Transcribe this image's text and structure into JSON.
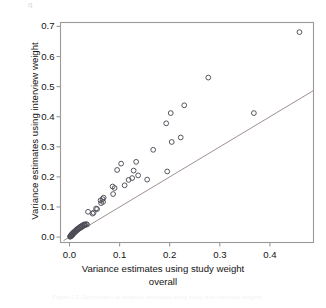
{
  "figure": {
    "top_artifact_text": "g",
    "bottom_artifact_text": "Figure 3.2 Comparison of variance estimates using study and interview weights"
  },
  "chart_data": {
    "type": "scatter",
    "title": "",
    "xlabel": "Variance estimates using study weight",
    "xlabel_line2": "overall",
    "ylabel": "Variance estimates using interview weight",
    "xlim": [
      -0.018,
      0.487
    ],
    "ylim": [
      -0.018,
      0.713
    ],
    "xticks": [
      0.0,
      0.1,
      0.2,
      0.3,
      0.4
    ],
    "xticklabels": [
      "0.0",
      "0.1",
      "0.2",
      "0.3",
      "0.4"
    ],
    "yticks": [
      0.0,
      0.1,
      0.2,
      0.3,
      0.4,
      0.5,
      0.6,
      0.7
    ],
    "yticklabels": [
      "0.0",
      "0.1",
      "0.2",
      "0.3",
      "0.4",
      "0.5",
      "0.6",
      "0.7"
    ],
    "grid": false,
    "legend": null,
    "marker": "open-circle",
    "marker_color": "#4d4d57",
    "marker_radius_px": 2.4,
    "frame_color": "#9a9a9a",
    "reference_line": {
      "label": "y = x identity line",
      "color": "#a08f8f",
      "from": [
        -0.012,
        -0.012
      ],
      "to": [
        0.487,
        0.487
      ]
    },
    "points": [
      [
        0.001,
        0.001
      ],
      [
        0.002,
        0.002
      ],
      [
        0.002,
        0.004
      ],
      [
        0.003,
        0.003
      ],
      [
        0.003,
        0.006
      ],
      [
        0.004,
        0.005
      ],
      [
        0.004,
        0.008
      ],
      [
        0.005,
        0.006
      ],
      [
        0.005,
        0.01
      ],
      [
        0.006,
        0.008
      ],
      [
        0.006,
        0.012
      ],
      [
        0.007,
        0.01
      ],
      [
        0.008,
        0.013
      ],
      [
        0.008,
        0.016
      ],
      [
        0.009,
        0.014
      ],
      [
        0.01,
        0.018
      ],
      [
        0.011,
        0.016
      ],
      [
        0.012,
        0.02
      ],
      [
        0.013,
        0.023
      ],
      [
        0.014,
        0.021
      ],
      [
        0.015,
        0.026
      ],
      [
        0.016,
        0.024
      ],
      [
        0.017,
        0.029
      ],
      [
        0.018,
        0.027
      ],
      [
        0.02,
        0.032
      ],
      [
        0.021,
        0.03
      ],
      [
        0.022,
        0.035
      ],
      [
        0.024,
        0.033
      ],
      [
        0.025,
        0.038
      ],
      [
        0.026,
        0.036
      ],
      [
        0.028,
        0.041
      ],
      [
        0.029,
        0.039
      ],
      [
        0.03,
        0.042
      ],
      [
        0.031,
        0.04
      ],
      [
        0.033,
        0.043
      ],
      [
        0.035,
        0.042
      ],
      [
        0.037,
        0.084
      ],
      [
        0.046,
        0.078
      ],
      [
        0.048,
        0.081
      ],
      [
        0.053,
        0.095
      ],
      [
        0.055,
        0.093
      ],
      [
        0.062,
        0.122
      ],
      [
        0.063,
        0.113
      ],
      [
        0.066,
        0.126
      ],
      [
        0.067,
        0.117
      ],
      [
        0.068,
        0.131
      ],
      [
        0.086,
        0.168
      ],
      [
        0.087,
        0.143
      ],
      [
        0.09,
        0.163
      ],
      [
        0.095,
        0.223
      ],
      [
        0.103,
        0.244
      ],
      [
        0.11,
        0.172
      ],
      [
        0.118,
        0.19
      ],
      [
        0.125,
        0.196
      ],
      [
        0.128,
        0.221
      ],
      [
        0.133,
        0.25
      ],
      [
        0.137,
        0.205
      ],
      [
        0.155,
        0.191
      ],
      [
        0.167,
        0.29
      ],
      [
        0.193,
        0.378
      ],
      [
        0.195,
        0.218
      ],
      [
        0.202,
        0.412
      ],
      [
        0.204,
        0.316
      ],
      [
        0.222,
        0.331
      ],
      [
        0.229,
        0.438
      ],
      [
        0.277,
        0.53
      ],
      [
        0.368,
        0.412
      ],
      [
        0.459,
        0.681
      ]
    ]
  }
}
